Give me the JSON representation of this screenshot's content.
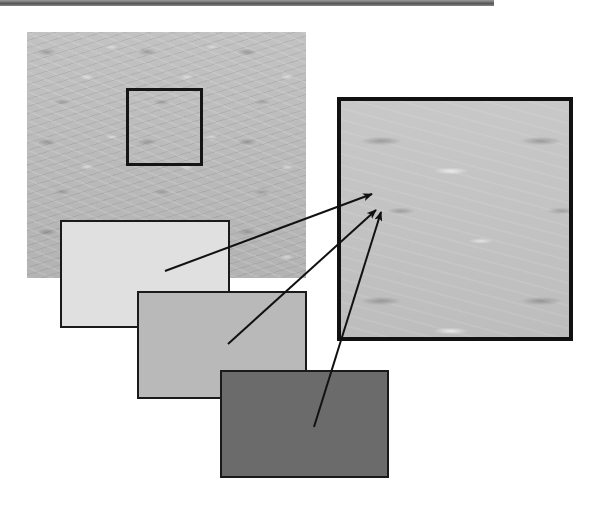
{
  "diagram": {
    "top_rule": {
      "color": "#5a5a5a"
    },
    "texture_image": {
      "label": "textured surface (full view)",
      "base_color": "#b9b9b9"
    },
    "selection_box": {
      "label": "selected region",
      "border_color": "#151515"
    },
    "zoom_view": {
      "label": "magnified texture region",
      "border_color": "#111111"
    },
    "swatches": [
      {
        "id": "light",
        "label": "light tone",
        "color": "#e0e0e0"
      },
      {
        "id": "medium",
        "label": "medium tone",
        "color": "#b9b9b9"
      },
      {
        "id": "dark",
        "label": "dark tone",
        "color": "#6b6b6b"
      }
    ],
    "arrows": [
      {
        "from": "light",
        "x1": 165,
        "y1": 271,
        "x2": 372,
        "y2": 194
      },
      {
        "from": "medium",
        "x1": 228,
        "y1": 344,
        "x2": 376,
        "y2": 210
      },
      {
        "from": "dark",
        "x1": 314,
        "y1": 427,
        "x2": 381,
        "y2": 212
      }
    ],
    "arrow_color": "#111111"
  }
}
